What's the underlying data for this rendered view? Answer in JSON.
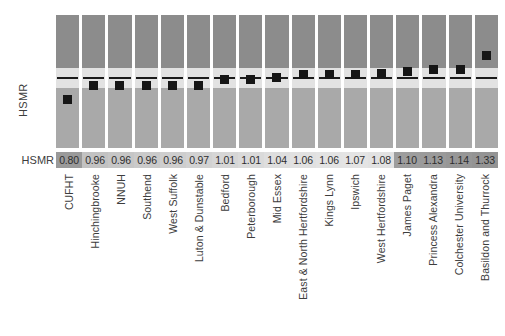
{
  "axis": {
    "y_label": "HSMR",
    "value_row_label": "HSMR"
  },
  "chart_data": {
    "type": "bar",
    "title": "",
    "subtitle": "",
    "xlabel": "",
    "ylabel": "HSMR",
    "grid": false,
    "legend": "none",
    "annotations": [
      "Each column shows a funnel/control band: dark upper band, light central confidence band with the expected reference line at 1.00, and a lighter lower band. The black square is the trust's HSMR point estimate."
    ],
    "reference_line": 1.0,
    "categories": [
      "CUFHT",
      "Hinchingbrooke",
      "NNUH",
      "Southend",
      "West Suffolk",
      "Luton & Dunstable",
      "Bedford",
      "Peterborough",
      "Mid Essex",
      "East & North Hertfordshire",
      "Kings Lynn",
      "Ipswich",
      "West Hertfordshire",
      "James Paget",
      "Princess Alexandra",
      "Colchester University",
      "Basildon and Thurrock"
    ],
    "values": [
      0.8,
      0.96,
      0.96,
      0.96,
      0.96,
      0.97,
      1.01,
      1.01,
      1.04,
      1.06,
      1.06,
      1.07,
      1.08,
      1.1,
      1.13,
      1.14,
      1.33
    ],
    "value_labels": [
      "0.80",
      "0.96",
      "0.96",
      "0.96",
      "0.96",
      "0.97",
      "1.01",
      "1.01",
      "1.04",
      "1.06",
      "1.06",
      "1.07",
      "1.08",
      "1.10",
      "1.13",
      "1.14",
      "1.33"
    ],
    "marker_top_px": [
      80,
      66,
      66,
      66,
      66,
      66,
      60,
      60,
      58,
      55,
      55,
      55,
      54,
      52,
      50,
      50,
      36
    ],
    "cell_shades": [
      "#9a9a9a",
      "#c2c2c2",
      "#c6c6c6",
      "#cacaca",
      "#cecece",
      "#d2d2d2",
      "#d6d6d6",
      "#dadada",
      "#dedede",
      "#e1e1e1",
      "#e3e3e3",
      "#e4e4e4",
      "#e2e2e2",
      "#9d9d9d",
      "#9a9a9a",
      "#979797",
      "#949494"
    ]
  },
  "colors": {
    "band_upper": "#8c8c8c",
    "band_ci": "#e2e2e2",
    "band_lower": "#a9a9a9",
    "marker": "#161616",
    "reference_line": "#1b1b1b",
    "background": "#ffffff",
    "text": "#3d3d3d"
  }
}
